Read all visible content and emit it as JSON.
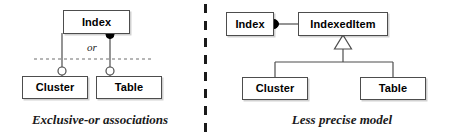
{
  "figure": {
    "background_color": "#ffffff",
    "box_border_color": "#4d4d4d",
    "line_color": "#4d4d4d",
    "accent_color": "#000000"
  },
  "divider": {
    "style": "vertical-dashed",
    "color": "#1a1a1a"
  },
  "left_panel": {
    "caption": "Exclusive-or associations",
    "or_label": "or",
    "boxes": {
      "index": "Index",
      "cluster": "Cluster",
      "table": "Table"
    },
    "markers": {
      "aggregation_diamond": "filled-circle",
      "endpoint_a": "open-circle",
      "endpoint_b": "open-circle",
      "constraint_line": "dashed"
    }
  },
  "right_panel": {
    "caption": "Less precise model",
    "boxes": {
      "index": "Index",
      "indexed_item": "IndexedItem",
      "cluster": "Cluster",
      "table": "Table"
    },
    "markers": {
      "aggregation_diamond": "filled-circle",
      "generalization": "hollow-triangle"
    }
  }
}
